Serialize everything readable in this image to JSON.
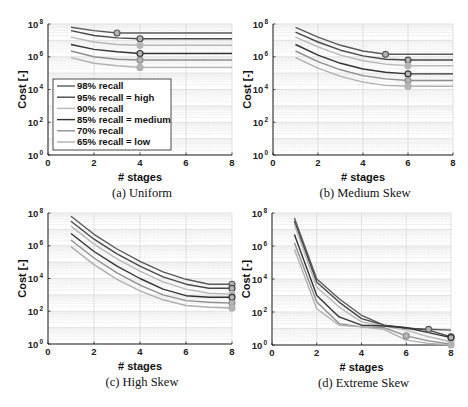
{
  "figure": {
    "legend": [
      {
        "label": "98% recall",
        "color": "#5a5a5a"
      },
      {
        "label": "95% recall = high",
        "color": "#484848"
      },
      {
        "label": "90% recall",
        "color": "#b8b8b8"
      },
      {
        "label": "85% recall = medium",
        "color": "#333333"
      },
      {
        "label": "70% recall",
        "color": "#8f8f8f"
      },
      {
        "label": "65% recall = low",
        "color": "#b0b0b0"
      }
    ]
  },
  "chart_data": [
    {
      "type": "line",
      "title": "(a) Uniform",
      "xlabel": "# stages",
      "ylabel": "Cost [-]",
      "yscale": "log",
      "xlim": [
        0,
        8
      ],
      "ylim": [
        1,
        100000000
      ],
      "xticks": [
        "0",
        "2",
        "4",
        "6",
        "8"
      ],
      "yticks": [
        "10^0",
        "10^2",
        "10^4",
        "10^6",
        "10^8"
      ],
      "grid": true,
      "legend_position": "lower left",
      "x": [
        1,
        2,
        3,
        4,
        5,
        6,
        7,
        8
      ],
      "series": [
        {
          "name": "98% recall",
          "log10_values": [
            7.8,
            7.6,
            7.45,
            7.45,
            7.45,
            7.45,
            7.45,
            7.45
          ],
          "marker_x": 3
        },
        {
          "name": "95% recall = high",
          "log10_values": [
            7.6,
            7.3,
            7.15,
            7.1,
            7.1,
            7.1,
            7.1,
            7.1
          ],
          "marker_x": 4
        },
        {
          "name": "90% recall",
          "log10_values": [
            7.2,
            6.9,
            6.75,
            6.7,
            6.7,
            6.7,
            6.7,
            6.7
          ],
          "marker_x": 4
        },
        {
          "name": "85% recall = medium",
          "log10_values": [
            6.75,
            6.45,
            6.3,
            6.2,
            6.2,
            6.2,
            6.2,
            6.2
          ],
          "marker_x": 4
        },
        {
          "name": "70% recall",
          "log10_values": [
            6.35,
            6.0,
            5.85,
            5.8,
            5.8,
            5.8,
            5.8,
            5.8
          ],
          "marker_x": 4
        },
        {
          "name": "65% recall = low",
          "log10_values": [
            5.95,
            5.6,
            5.45,
            5.35,
            5.35,
            5.35,
            5.35,
            5.35
          ],
          "marker_x": 4
        }
      ]
    },
    {
      "type": "line",
      "title": "(b) Medium Skew",
      "xlabel": "# stages",
      "ylabel": "Cost [-]",
      "yscale": "log",
      "xlim": [
        0,
        8
      ],
      "ylim": [
        1,
        100000000
      ],
      "xticks": [
        "0",
        "2",
        "4",
        "6",
        "8"
      ],
      "yticks": [
        "10^0",
        "10^2",
        "10^4",
        "10^6",
        "10^8"
      ],
      "grid": true,
      "x": [
        1,
        2,
        3,
        4,
        5,
        6,
        7,
        8
      ],
      "series": [
        {
          "name": "98% recall",
          "log10_values": [
            7.8,
            7.2,
            6.7,
            6.35,
            6.15,
            6.15,
            6.15,
            6.15
          ],
          "marker_x": 5
        },
        {
          "name": "95% recall = high",
          "log10_values": [
            7.5,
            6.9,
            6.4,
            6.05,
            5.85,
            5.8,
            5.8,
            5.8
          ],
          "marker_x": 6
        },
        {
          "name": "90% recall",
          "log10_values": [
            7.2,
            6.6,
            6.1,
            5.75,
            5.55,
            5.45,
            5.45,
            5.45
          ],
          "marker_x": 6
        },
        {
          "name": "85% recall = medium",
          "log10_values": [
            6.75,
            6.1,
            5.6,
            5.25,
            5.05,
            4.95,
            4.95,
            4.95
          ],
          "marker_x": 6
        },
        {
          "name": "70% recall",
          "log10_values": [
            6.35,
            5.7,
            5.2,
            4.85,
            4.65,
            4.55,
            4.55,
            4.55
          ],
          "marker_x": 6
        },
        {
          "name": "65% recall = low",
          "log10_values": [
            5.95,
            5.3,
            4.8,
            4.45,
            4.25,
            4.2,
            4.2,
            4.2
          ],
          "marker_x": 6
        }
      ]
    },
    {
      "type": "line",
      "title": "(c) High Skew",
      "xlabel": "# stages",
      "ylabel": "Cost [-]",
      "yscale": "log",
      "xlim": [
        0,
        8
      ],
      "ylim": [
        1,
        100000000
      ],
      "xticks": [
        "0",
        "2",
        "4",
        "6",
        "8"
      ],
      "yticks": [
        "10^0",
        "10^2",
        "10^4",
        "10^6",
        "10^8"
      ],
      "grid": true,
      "x": [
        1,
        2,
        3,
        4,
        5,
        6,
        7,
        8
      ],
      "series": [
        {
          "name": "98% recall",
          "log10_values": [
            7.8,
            6.7,
            5.8,
            5.05,
            4.4,
            3.95,
            3.65,
            3.65
          ],
          "marker_x": 8
        },
        {
          "name": "95% recall = high",
          "log10_values": [
            7.5,
            6.4,
            5.5,
            4.75,
            4.1,
            3.65,
            3.4,
            3.4
          ],
          "marker_x": 8
        },
        {
          "name": "90% recall",
          "log10_values": [
            7.2,
            6.1,
            5.2,
            4.45,
            3.8,
            3.35,
            3.1,
            3.05
          ],
          "marker_x": 8
        },
        {
          "name": "85% recall = medium",
          "log10_values": [
            6.75,
            5.65,
            4.75,
            4.0,
            3.35,
            2.95,
            2.85,
            2.85
          ],
          "marker_x": 8
        },
        {
          "name": "70% recall",
          "log10_values": [
            6.35,
            5.25,
            4.35,
            3.6,
            3.0,
            2.65,
            2.55,
            2.5
          ],
          "marker_x": 8
        },
        {
          "name": "65% recall = low",
          "log10_values": [
            5.95,
            4.85,
            3.95,
            3.25,
            2.7,
            2.35,
            2.25,
            2.2
          ],
          "marker_x": 8
        }
      ]
    },
    {
      "type": "line",
      "title": "(d) Extreme Skew",
      "xlabel": "# stages",
      "ylabel": "Cost [-]",
      "yscale": "log",
      "xlim": [
        0,
        8
      ],
      "ylim": [
        1,
        100000000
      ],
      "xticks": [
        "0",
        "2",
        "4",
        "6",
        "8"
      ],
      "yticks": [
        "10^0",
        "10^2",
        "10^4",
        "10^6",
        "10^8"
      ],
      "grid": true,
      "x": [
        1,
        2,
        3,
        4,
        5,
        6,
        7,
        8
      ],
      "series": [
        {
          "name": "98% recall",
          "log10_values": [
            7.7,
            4.0,
            2.8,
            1.8,
            1.2,
            1.0,
            0.95,
            0.9
          ],
          "marker_x": 7
        },
        {
          "name": "95% recall = high",
          "log10_values": [
            7.5,
            3.8,
            2.6,
            1.6,
            1.2,
            1.05,
            0.9,
            0.5
          ],
          "marker_x": 8
        },
        {
          "name": "90% recall",
          "log10_values": [
            7.3,
            3.5,
            2.3,
            1.4,
            1.15,
            0.9,
            0.5,
            0.2
          ],
          "marker_x": 8
        },
        {
          "name": "85% recall = medium",
          "log10_values": [
            6.7,
            3.0,
            1.7,
            1.2,
            1.15,
            1.05,
            0.75,
            0.45
          ],
          "marker_x": 8
        },
        {
          "name": "70% recall",
          "log10_values": [
            6.2,
            2.6,
            1.3,
            1.1,
            1.05,
            0.55,
            0.25,
            0.05
          ],
          "marker_x": 6
        },
        {
          "name": "65% recall = low",
          "log10_values": [
            5.8,
            2.2,
            1.2,
            1.1,
            0.95,
            0.3,
            0.1,
            0.0
          ],
          "marker_x": 8
        }
      ]
    }
  ]
}
